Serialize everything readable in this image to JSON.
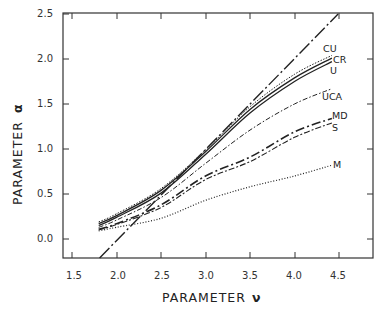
{
  "chart_data": {
    "type": "line",
    "title": "",
    "xlabel": "PARAMETER ν",
    "ylabel": "PARAMETER α",
    "xlim": [
      1.5,
      4.9
    ],
    "ylim": [
      -0.21,
      2.5
    ],
    "xticks": [
      1.5,
      2.0,
      2.5,
      3.0,
      3.5,
      4.0,
      4.5
    ],
    "xtick_labels": [
      "1.5",
      "2.0",
      "2.5",
      "3.0",
      "3.5",
      "4.0",
      "4.5"
    ],
    "yticks": [
      0.0,
      0.5,
      1.0,
      1.5,
      2.0,
      2.5
    ],
    "ytick_labels": [
      "0.0",
      "0.5",
      "1.0",
      "1.5",
      "2.0",
      "2.5"
    ],
    "grid": false,
    "legend": "inline labels at right end of curves",
    "series": [
      {
        "name": "reference line",
        "label": "",
        "style": "long-dash-dot",
        "x": [
          1.81,
          4.49
        ],
        "y": [
          -0.21,
          2.5
        ]
      },
      {
        "name": "CU",
        "label": "CU",
        "style": "dotted-fine",
        "x": [
          1.8,
          2.0,
          2.5,
          3.0,
          3.5,
          4.0,
          4.42
        ],
        "y": [
          0.19,
          0.28,
          0.56,
          0.99,
          1.47,
          1.83,
          2.04
        ]
      },
      {
        "name": "CR",
        "label": "CR",
        "style": "solid",
        "x": [
          1.8,
          2.0,
          2.5,
          3.0,
          3.5,
          4.0,
          4.42
        ],
        "y": [
          0.17,
          0.26,
          0.54,
          0.97,
          1.44,
          1.79,
          2.01
        ]
      },
      {
        "name": "U",
        "label": "U",
        "style": "solid",
        "x": [
          1.8,
          2.0,
          2.5,
          3.0,
          3.5,
          4.0,
          4.42
        ],
        "y": [
          0.15,
          0.24,
          0.51,
          0.94,
          1.4,
          1.75,
          1.97
        ]
      },
      {
        "name": "UCA",
        "label": "UCA",
        "style": "dash-dot-fine",
        "x": [
          1.8,
          2.0,
          2.5,
          3.0,
          3.5,
          4.0,
          4.42
        ],
        "y": [
          0.13,
          0.21,
          0.46,
          0.84,
          1.21,
          1.5,
          1.67
        ]
      },
      {
        "name": "MD",
        "label": "MD",
        "style": "long-dash",
        "x": [
          1.8,
          2.0,
          2.5,
          3.0,
          3.5,
          4.0,
          4.42
        ],
        "y": [
          0.11,
          0.17,
          0.38,
          0.7,
          0.91,
          1.19,
          1.34
        ]
      },
      {
        "name": "S",
        "label": "S",
        "style": "dash-dot",
        "x": [
          1.8,
          2.0,
          2.5,
          3.0,
          3.5,
          4.0,
          4.42
        ],
        "y": [
          0.1,
          0.16,
          0.35,
          0.66,
          0.86,
          1.13,
          1.29
        ]
      },
      {
        "name": "M",
        "label": "M",
        "style": "dotted",
        "x": [
          1.8,
          2.0,
          2.5,
          3.0,
          3.5,
          4.0,
          4.42
        ],
        "y": [
          0.09,
          0.13,
          0.23,
          0.43,
          0.58,
          0.7,
          0.82
        ]
      }
    ]
  },
  "axes": {
    "x_title_main": "PARAMETER",
    "x_title_symbol": "ν",
    "y_title_main": "PARAMETER",
    "y_title_symbol": "α"
  },
  "labels": {
    "CU": "CU",
    "CR": "CR",
    "U": "U",
    "UCA": "UCA",
    "MD": "MD",
    "S": "S",
    "M": "M"
  }
}
